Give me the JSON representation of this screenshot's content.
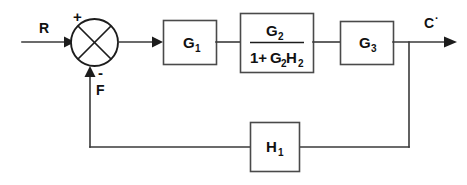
{
  "diagram": {
    "type": "control-system-block-diagram",
    "background_color": "#ffffff",
    "line_color": "#3a3a3a",
    "text_color": "#111111",
    "signals": {
      "input_label": "R",
      "feedback_label": "F",
      "output_label": "C",
      "output_prime": "·",
      "plus_sign": "+",
      "minus_sign": "-"
    },
    "blocks": {
      "g1": {
        "label": "G",
        "subscript": "1"
      },
      "g3": {
        "label": "G",
        "subscript": "3"
      },
      "h1": {
        "label": "H",
        "subscript": "1"
      },
      "transfer": {
        "numerator_main": "G",
        "numerator_sub": "2",
        "den_one": "1+",
        "den_g": "G",
        "den_g_sub": "2",
        "den_h": "H",
        "den_h_sub": "2"
      }
    },
    "summing_junction": {
      "name": "summing-junction",
      "shape": "circle-with-x"
    }
  }
}
